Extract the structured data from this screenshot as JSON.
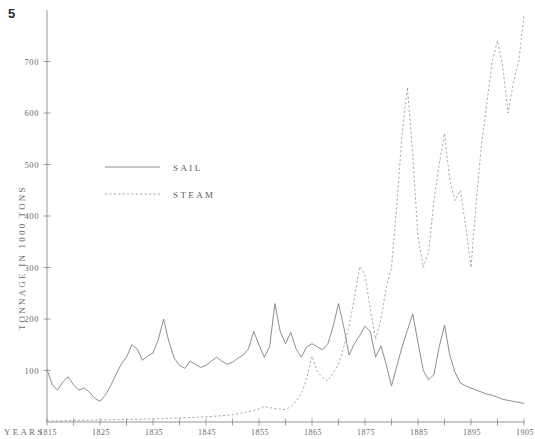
{
  "figure": {
    "number": "5"
  },
  "chart_data": {
    "type": "line",
    "title": "",
    "xlabel": "YEARS",
    "ylabel": "TONNAGE IN 1000 TONS",
    "grid": false,
    "legend_position": "upper-left-inside",
    "xlim": [
      1815,
      1905
    ],
    "ylim": [
      0,
      800
    ],
    "yticks": [
      100,
      200,
      300,
      400,
      500,
      600,
      700
    ],
    "ytick_labels": [
      "100",
      "200",
      "300",
      "400",
      "500",
      "600",
      "700"
    ],
    "xticks": [
      1815,
      1825,
      1835,
      1845,
      1855,
      1865,
      1875,
      1885,
      1895,
      1905
    ],
    "xtick_labels": [
      "1815",
      "1825",
      "1835",
      "1845",
      "1855",
      "1865",
      "1875",
      "1885",
      "1895",
      "1905"
    ],
    "xtick_minor_interval": 5,
    "series": [
      {
        "name": "SAIL",
        "style": "solid",
        "color": "#7a7a7a",
        "x": [
          1815,
          1816,
          1817,
          1818,
          1819,
          1820,
          1821,
          1822,
          1823,
          1824,
          1825,
          1826,
          1827,
          1828,
          1829,
          1830,
          1831,
          1832,
          1833,
          1834,
          1835,
          1836,
          1837,
          1838,
          1839,
          1840,
          1841,
          1842,
          1843,
          1844,
          1845,
          1846,
          1847,
          1848,
          1849,
          1850,
          1851,
          1852,
          1853,
          1854,
          1855,
          1856,
          1857,
          1858,
          1859,
          1860,
          1861,
          1862,
          1863,
          1864,
          1865,
          1866,
          1867,
          1868,
          1869,
          1870,
          1871,
          1872,
          1873,
          1874,
          1875,
          1876,
          1877,
          1878,
          1879,
          1880,
          1881,
          1882,
          1883,
          1884,
          1885,
          1886,
          1887,
          1888,
          1889,
          1890,
          1891,
          1892,
          1893,
          1894,
          1895,
          1896,
          1897,
          1898,
          1899,
          1900,
          1901,
          1902,
          1903,
          1904,
          1905
        ],
        "y": [
          102,
          72,
          62,
          78,
          88,
          72,
          62,
          66,
          58,
          46,
          40,
          52,
          70,
          92,
          112,
          126,
          150,
          142,
          120,
          128,
          134,
          160,
          200,
          156,
          124,
          110,
          104,
          118,
          112,
          106,
          110,
          118,
          126,
          118,
          112,
          116,
          124,
          130,
          142,
          176,
          150,
          126,
          146,
          230,
          176,
          152,
          174,
          142,
          126,
          146,
          152,
          146,
          140,
          152,
          186,
          230,
          184,
          130,
          152,
          168,
          186,
          176,
          126,
          148,
          112,
          70,
          108,
          146,
          178,
          210,
          154,
          100,
          82,
          92,
          146,
          188,
          130,
          96,
          76,
          70,
          66,
          62,
          58,
          54,
          52,
          48,
          44,
          42,
          40,
          38,
          36
        ]
      },
      {
        "name": "STEAM",
        "style": "dashed",
        "color": "#9a9a9a",
        "x": [
          1815,
          1820,
          1825,
          1830,
          1835,
          1840,
          1845,
          1850,
          1852,
          1854,
          1856,
          1858,
          1860,
          1861,
          1862,
          1863,
          1864,
          1865,
          1866,
          1867,
          1868,
          1869,
          1870,
          1871,
          1872,
          1873,
          1874,
          1875,
          1876,
          1877,
          1878,
          1879,
          1880,
          1881,
          1882,
          1883,
          1884,
          1885,
          1886,
          1887,
          1888,
          1889,
          1890,
          1891,
          1892,
          1893,
          1894,
          1895,
          1896,
          1897,
          1898,
          1899,
          1900,
          1901,
          1902,
          1903,
          1904,
          1905
        ],
        "y": [
          2,
          3,
          4,
          5,
          6,
          8,
          10,
          14,
          18,
          22,
          30,
          26,
          24,
          30,
          40,
          56,
          84,
          128,
          98,
          86,
          80,
          96,
          112,
          146,
          186,
          240,
          302,
          286,
          220,
          160,
          200,
          260,
          300,
          420,
          560,
          650,
          520,
          360,
          300,
          330,
          430,
          500,
          560,
          470,
          430,
          450,
          380,
          300,
          430,
          540,
          620,
          700,
          740,
          690,
          600,
          660,
          700,
          790
        ]
      }
    ]
  },
  "legend": {
    "items": [
      {
        "label": "SAIL",
        "style": "solid"
      },
      {
        "label": "STEAM",
        "style": "dashed"
      }
    ]
  }
}
